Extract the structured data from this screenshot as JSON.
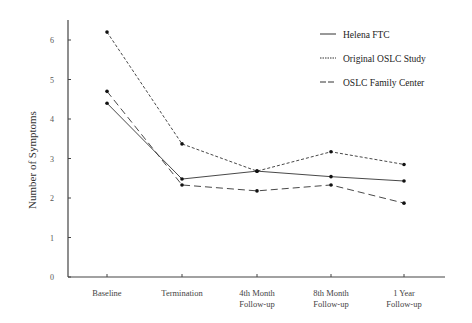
{
  "chart_data": {
    "type": "line",
    "title": "",
    "xlabel": "",
    "ylabel": "Number of Symptoms",
    "ylim": [
      0,
      6.5
    ],
    "yticks": [
      0,
      1,
      2,
      3,
      4,
      5,
      6
    ],
    "grid": false,
    "legend_position": "top-right",
    "categories": [
      [
        "Baseline"
      ],
      [
        "Termination"
      ],
      [
        "4th Month",
        "Follow-up"
      ],
      [
        "8th Month",
        "Follow-up"
      ],
      [
        "1 Year",
        "Follow-up"
      ]
    ],
    "series": [
      {
        "name": "Helena FTC",
        "style": "solid",
        "values": [
          4.4,
          2.48,
          2.68,
          2.54,
          2.43
        ]
      },
      {
        "name": "Original OSLC Study",
        "style": "dotted",
        "values": [
          6.2,
          3.37,
          2.68,
          3.17,
          2.85
        ]
      },
      {
        "name": "OSLC Family Center",
        "style": "dashed",
        "values": [
          4.7,
          2.33,
          2.18,
          2.33,
          1.87
        ]
      }
    ]
  },
  "colors": {
    "line": "#333333",
    "axis": "#444444"
  }
}
